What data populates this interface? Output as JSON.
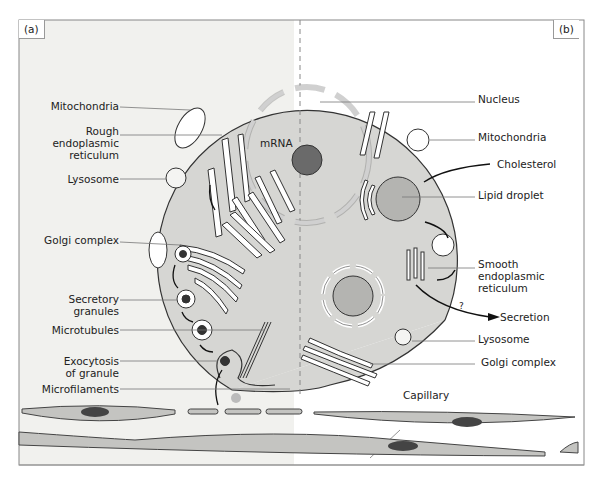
{
  "panels": {
    "a": "(a)",
    "b": "(b)"
  },
  "labels_left": {
    "mitochondria": "Mitochondria",
    "rough_er": [
      "Rough",
      "endoplasmic",
      "reticulum"
    ],
    "lysosome": "Lysosome",
    "golgi": "Golgi complex",
    "secretory_granules": [
      "Secretory",
      "granules"
    ],
    "microtubules": "Microtubules",
    "exocytosis": [
      "Exocytosis",
      "of granule"
    ],
    "microfilaments": "Microfilaments"
  },
  "labels_center": {
    "mrna": "mRNA"
  },
  "labels_right": {
    "nucleus": "Nucleus",
    "mitochondria": "Mitochondria",
    "cholesterol": "Cholesterol",
    "lipid_droplet": "Lipid droplet",
    "smooth_er": [
      "Smooth",
      "endoplasmic",
      "reticulum"
    ],
    "question": "?",
    "secretion": "Secretion",
    "lysosome": "Lysosome",
    "golgi": "Golgi complex",
    "capillary": "Capillary"
  },
  "colors": {
    "left_bg": "#f1f1ee",
    "cell_fill": "#d6d6d3",
    "nucleolus": "#6a6a6a",
    "droplet": "#b4b4b1",
    "border": "#888888",
    "endothelium": "#c4c4c1"
  }
}
